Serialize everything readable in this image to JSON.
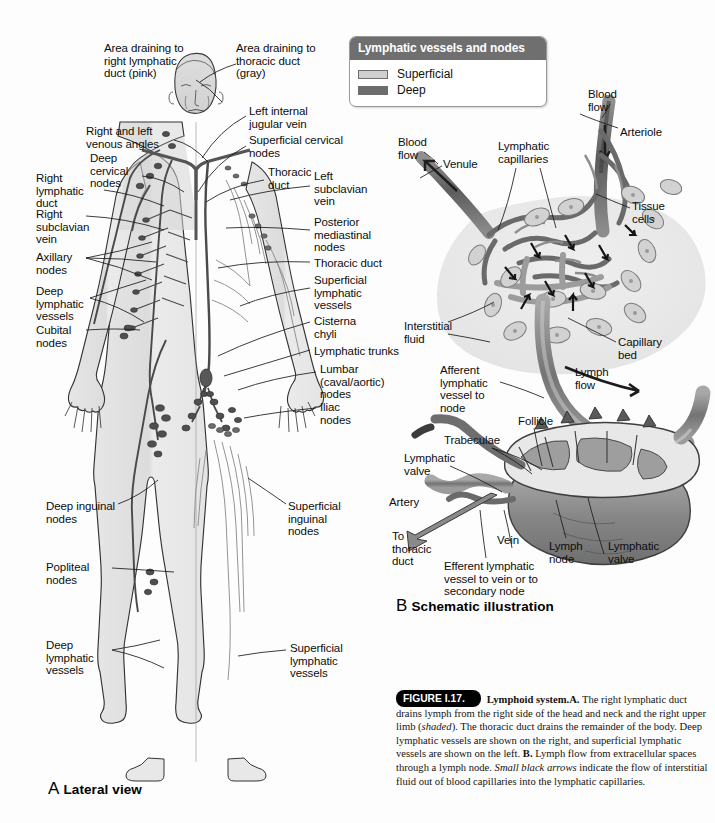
{
  "figure": {
    "tag": "FIGURE I.17.",
    "title": "Lymphoid system.",
    "body_1": "A.",
    "text_1": " The right lymphatic duct drains lymph from the right side of the head and neck and the right upper limb (",
    "italic_1": "shaded",
    "text_2": "). The thoracic duct drains the remainder of the body. Deep lymphatic vessels are shown on the right, and superficial lymphatic vessels are shown on the left. ",
    "body_2": "B.",
    "text_3": " Lymph flow from extracellular spaces through a lymph node. ",
    "italic_2": "Small black arrows",
    "text_4": " indicate the flow of interstitial fluid out of blood capillaries into the lymphatic capillaries."
  },
  "legend": {
    "title": "Lymphatic vessels and nodes",
    "items": [
      {
        "label": "Superficial",
        "color": "#cfcfcf"
      },
      {
        "label": "Deep",
        "color": "#6d6d6d"
      }
    ]
  },
  "panels": [
    {
      "letter": "A",
      "name": "Lateral view"
    },
    {
      "letter": "B",
      "name": "Schematic illustration"
    }
  ],
  "panel_a_labels": [
    {
      "id": "area-right-duct",
      "text": "Area draining to\nright lymphatic\nduct (pink)"
    },
    {
      "id": "area-thoracic-duct",
      "text": "Area draining to\nthoracic duct\n(gray)"
    },
    {
      "id": "venous-angles",
      "text": "Right and left\nvenous angles"
    },
    {
      "id": "deep-cervical-nodes",
      "text": "Deep\ncervical\nnodes"
    },
    {
      "id": "right-lymphatic-duct",
      "text": "Right\nlymphatic\nduct"
    },
    {
      "id": "right-subclavian-vein",
      "text": "Right\nsubclavian\nvein"
    },
    {
      "id": "axillary-nodes",
      "text": "Axillary\nnodes"
    },
    {
      "id": "deep-lymphatic-vessels-upper",
      "text": "Deep\nlymphatic\nvessels"
    },
    {
      "id": "cubital-nodes",
      "text": "Cubital\nnodes"
    },
    {
      "id": "deep-inguinal-nodes",
      "text": "Deep inguinal\nnodes"
    },
    {
      "id": "popliteal-nodes",
      "text": "Popliteal\nnodes"
    },
    {
      "id": "deep-lymphatic-vessels-lower",
      "text": "Deep\nlymphatic\nvessels"
    },
    {
      "id": "left-internal-jugular-vein",
      "text": "Left internal\njugular vein"
    },
    {
      "id": "superficial-cervical-nodes",
      "text": "Superficial cervical\nnodes"
    },
    {
      "id": "thoracic-duct-upper",
      "text": "Thoracic\nduct"
    },
    {
      "id": "left-subclavian-vein",
      "text": "Left\nsubclavian\nvein"
    },
    {
      "id": "posterior-mediastinal-nodes",
      "text": "Posterior\nmediastinal\nnodes"
    },
    {
      "id": "thoracic-duct",
      "text": "Thoracic duct"
    },
    {
      "id": "superficial-lymphatic-vessels-upper",
      "text": "Superficial\nlymphatic\nvessels"
    },
    {
      "id": "cisterna-chyli",
      "text": "Cisterna\nchyli"
    },
    {
      "id": "lymphatic-trunks",
      "text": "Lymphatic trunks"
    },
    {
      "id": "lumbar-nodes",
      "text": "Lumbar\n(caval/aortic)\nnodes"
    },
    {
      "id": "iliac-nodes",
      "text": "Iliac\nnodes"
    },
    {
      "id": "superficial-inguinal-nodes",
      "text": "Superficial\ninguinal\nnodes"
    },
    {
      "id": "superficial-lymphatic-vessels-lower",
      "text": "Superficial\nlymphatic\nvessels"
    }
  ],
  "panel_b_labels": [
    {
      "id": "blood-flow-right",
      "text": "Blood\nflow"
    },
    {
      "id": "arteriole",
      "text": "Arteriole"
    },
    {
      "id": "blood-flow-left",
      "text": "Blood\nflow"
    },
    {
      "id": "venule",
      "text": "Venule"
    },
    {
      "id": "lymphatic-capillaries",
      "text": "Lymphatic\ncapillaries"
    },
    {
      "id": "tissue-cells",
      "text": "Tissue\ncells"
    },
    {
      "id": "interstitial-fluid",
      "text": "Interstitial\nfluid"
    },
    {
      "id": "capillary-bed",
      "text": "Capillary\nbed"
    },
    {
      "id": "afferent-lymphatic-vessel",
      "text": "Afferent\nlymphatic\nvessel to\nnode"
    },
    {
      "id": "lymph-flow",
      "text": "Lymph\nflow"
    },
    {
      "id": "trabeculae",
      "text": "Trabeculae"
    },
    {
      "id": "follicle",
      "text": "Follicle"
    },
    {
      "id": "lymphatic-valve-left",
      "text": "Lymphatic\nvalve"
    },
    {
      "id": "artery",
      "text": "Artery"
    },
    {
      "id": "to-thoracic-duct",
      "text": "To\nthoracic\nduct"
    },
    {
      "id": "efferent-lymphatic-vessel",
      "text": "Efferent lymphatic\nvessel to vein or to\nsecondary node"
    },
    {
      "id": "vein",
      "text": "Vein"
    },
    {
      "id": "lymph-node",
      "text": "Lymph\nnode"
    },
    {
      "id": "lymphatic-valve-right",
      "text": "Lymphatic\nvalve"
    }
  ]
}
